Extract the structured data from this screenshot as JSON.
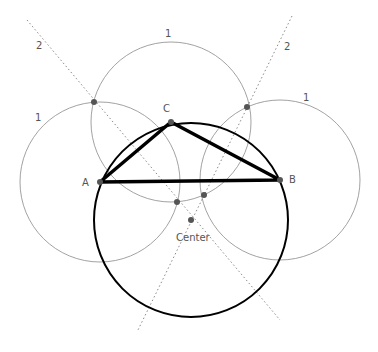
{
  "diagram": {
    "colors": {
      "thin": "#8a8a8a",
      "thick": "#000000",
      "point": "#555555",
      "label": "#555555"
    },
    "vertices": [
      {
        "name": "A",
        "x": 100,
        "y": 182,
        "lx": 82,
        "ly": 186
      },
      {
        "name": "B",
        "x": 280,
        "y": 180,
        "lx": 289,
        "ly": 183
      },
      {
        "name": "C",
        "x": 171,
        "y": 122,
        "lx": 163,
        "ly": 112
      }
    ],
    "center": {
      "label": "Center",
      "x": 191,
      "y": 220,
      "lx": 176,
      "ly": 241
    },
    "circumcircle_radius": 97,
    "construction_circles": [
      {
        "label": "1",
        "cx": 100,
        "cy": 182,
        "r": 80,
        "lx": 35,
        "ly": 121
      },
      {
        "label": "1",
        "cx": 171,
        "cy": 122,
        "r": 80,
        "lx": 165,
        "ly": 37
      },
      {
        "label": "1",
        "cx": 280,
        "cy": 180,
        "r": 80,
        "lx": 303,
        "ly": 101
      }
    ],
    "intersections": [
      {
        "x": 94,
        "y": 102
      },
      {
        "x": 247,
        "y": 107
      },
      {
        "x": 177,
        "y": 202
      },
      {
        "x": 204,
        "y": 195
      }
    ],
    "bisectors": [
      {
        "label": "2",
        "x1": 27,
        "y1": 20,
        "x2": 280,
        "y2": 320,
        "lx": 36,
        "ly": 49
      },
      {
        "label": "2",
        "x1": 292,
        "y1": 16,
        "x2": 137,
        "y2": 332,
        "lx": 284,
        "ly": 50
      }
    ]
  }
}
